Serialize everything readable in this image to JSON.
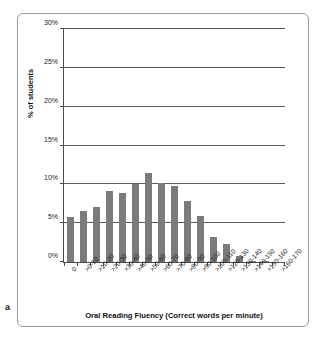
{
  "figure": {
    "panel_letter": "a"
  },
  "chart_data": {
    "type": "bar",
    "title": "",
    "xlabel": "Oral Reading Fluency (Correct words per minute)",
    "ylabel": "% of students",
    "categories": [
      "0",
      ">0-10",
      ">10-20",
      ">20-30",
      ">30-40",
      ">40-50",
      ">50-60",
      ">60-70",
      ">70-80",
      ">80-90",
      ">90-100",
      ">100-110",
      ">120-130",
      ">130-140",
      ">140-150",
      ">150-160",
      ">160-170"
    ],
    "values": [
      5.8,
      6.6,
      7.1,
      9.2,
      8.9,
      10.1,
      11.5,
      10.2,
      9.8,
      7.9,
      5.9,
      3.2,
      2.3,
      0.8,
      0.15,
      0.15,
      0.05
    ],
    "ylim": [
      0,
      30
    ],
    "ytick_labels": [
      "0%",
      "5%",
      "10%",
      "15%",
      "20%",
      "25%",
      "30%"
    ],
    "ytick_values": [
      0,
      5,
      10,
      15,
      20,
      25,
      30
    ],
    "grid": true,
    "legend": false,
    "bar_color": "#7b7b7b",
    "axis_color": "#4a4a4a"
  }
}
